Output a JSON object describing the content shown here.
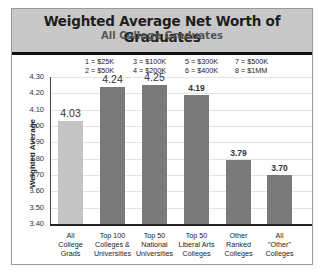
{
  "header": {
    "title": "Weighted Average Net Worth of Graduates",
    "subtitle": "All College Graduates"
  },
  "legend": [
    "1 = $25K\n2 = $50K",
    "3 = $100K\n4 = $200K",
    "5 = $300K\n6 = $400K",
    "7 = $500K\n8 = $1MM"
  ],
  "axis": {
    "ylabel": "Weighted Average",
    "yticks": [
      "4.30",
      "4.20",
      "4.10",
      "4.00",
      "3.90",
      "3.80",
      "3.70",
      "3.60",
      "3.50",
      "3.40"
    ]
  },
  "bars": [
    {
      "label": "All\nCollege\nGrads",
      "value": "4.03"
    },
    {
      "label": "Top 100\nColleges &\nUniversities",
      "value": "4.24"
    },
    {
      "label": "Top 50\nNational\nUniversities",
      "value": "4.25"
    },
    {
      "label": "Top 50\nLiberal Arts\nColleges",
      "value": "4.19"
    },
    {
      "label": "Other\nRanked\nColleges",
      "value": "3.79"
    },
    {
      "label": "All\n\"Other\"\nColleges",
      "value": "3.70"
    }
  ],
  "colors": {
    "highlight_bar": "#c4c4c4",
    "bar": "#7a7a7a",
    "header_bg": "#c8c8c8"
  },
  "chart_data": {
    "type": "bar",
    "title": "Weighted Average Net Worth of Graduates",
    "subtitle": "All College Graduates",
    "categories": [
      "All College Grads",
      "Top 100 Colleges & Universities",
      "Top 50 National Universities",
      "Top 50 Liberal Arts Colleges",
      "Other Ranked Colleges",
      "All \"Other\" Colleges"
    ],
    "values": [
      4.03,
      4.24,
      4.25,
      4.19,
      3.79,
      3.7
    ],
    "xlabel": "",
    "ylabel": "Weighted Average",
    "ylim": [
      3.4,
      4.3
    ],
    "yticks": [
      3.4,
      3.5,
      3.6,
      3.7,
      3.8,
      3.9,
      4.0,
      4.1,
      4.2,
      4.3
    ],
    "grid": true,
    "annotations": [
      "1 = $25K",
      "2 = $50K",
      "3 = $100K",
      "4 = $200K",
      "5 = $300K",
      "6 = $400K",
      "7 = $500K",
      "8 = $1MM"
    ]
  }
}
